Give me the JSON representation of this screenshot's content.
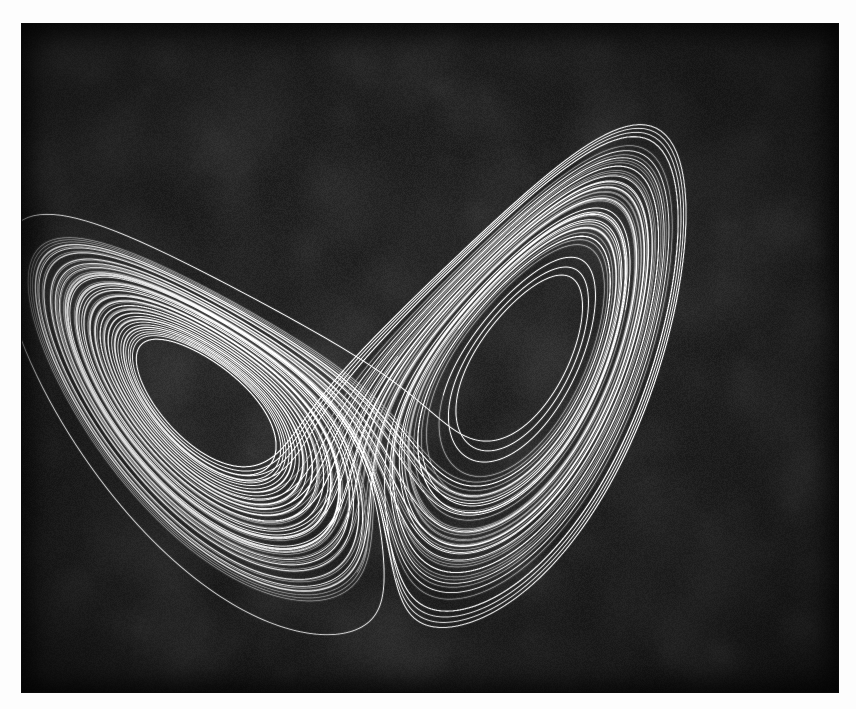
{
  "figure": {
    "title": "Lorenz attractor",
    "caption": "",
    "background_color": "#1b1b1b",
    "page_color": "#fdfdfd",
    "line_color": "#f2f2f2",
    "plot_left": 22,
    "plot_top": 24,
    "plot_width": 816,
    "plot_height": 668
  },
  "chart_data": {
    "type": "line",
    "title": "Lorenz attractor",
    "subtitle": "",
    "xlabel": "",
    "ylabel": "",
    "projection": "x-z phase portrait",
    "grid": false,
    "legend": "none",
    "axes_visible": false,
    "tick_labels_x": [],
    "tick_labels_y": [],
    "xlim": [
      -21.0,
      21.0
    ],
    "ylim": [
      0.0,
      50.0
    ],
    "line_color": "#f2f2f2",
    "line_width": 0.6,
    "background_color": "#1b1b1b",
    "system": {
      "name": "Lorenz 1963",
      "equations": [
        "dx/dt = sigma * (y - x)",
        "dy/dt = x * (rho - z) - y",
        "dz/dt = x * y - beta * z"
      ],
      "sigma": 10.0,
      "rho": 28.0,
      "beta": 2.6666666667
    },
    "integration": {
      "method": "rk4",
      "dt": 0.0035,
      "steps": 26000,
      "transient_skip": 600,
      "initial_condition": [
        0.9,
        1.4,
        15.0
      ]
    },
    "fixed_points": [
      {
        "label": "C-",
        "x": -8.485,
        "z": 27.0,
        "screen_x": 288,
        "screen_y": 361
      },
      {
        "label": "C+",
        "x": 8.485,
        "z": 27.0,
        "screen_x": 608,
        "screen_y": 351
      }
    ],
    "series": [
      {
        "name": "trajectory",
        "color": "#f2f2f2",
        "points_count": 26000
      }
    ],
    "annotations": []
  },
  "render": {
    "grain_amount": 0.26,
    "grain_tile": 140,
    "line_alpha": 0.5,
    "glow_alpha": 0.1,
    "view_scale_x": 18.2,
    "view_scale_y": 12.0,
    "view_center_x": 408,
    "view_center_y": 700,
    "rotation_deg": -8.0
  }
}
